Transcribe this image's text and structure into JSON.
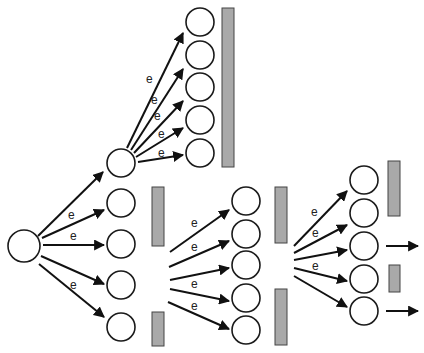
{
  "diagram": {
    "type": "branching tree of nodes with gray bars",
    "edge_label": "e",
    "colors": {
      "node_stroke": "#1a1a1a",
      "bar_fill": "#a9a9a9",
      "edge": "#111111",
      "background": "#ffffff"
    },
    "source": {
      "x": 24,
      "y": 246,
      "r": 16
    },
    "nodes": [
      {
        "id": "t1",
        "x": 200,
        "y": 22,
        "r": 14
      },
      {
        "id": "t2",
        "x": 200,
        "y": 55,
        "r": 14
      },
      {
        "id": "t3",
        "x": 200,
        "y": 87,
        "r": 14
      },
      {
        "id": "t4",
        "x": 200,
        "y": 120,
        "r": 14
      },
      {
        "id": "t5",
        "x": 200,
        "y": 153,
        "r": 14
      },
      {
        "id": "a0",
        "x": 121,
        "y": 163,
        "r": 14
      },
      {
        "id": "a1",
        "x": 121,
        "y": 203,
        "r": 14
      },
      {
        "id": "a2",
        "x": 121,
        "y": 244,
        "r": 14
      },
      {
        "id": "a3",
        "x": 121,
        "y": 285,
        "r": 14
      },
      {
        "id": "a4",
        "x": 121,
        "y": 327,
        "r": 14
      },
      {
        "id": "m1",
        "x": 246,
        "y": 201,
        "r": 14
      },
      {
        "id": "m2",
        "x": 246,
        "y": 234,
        "r": 14
      },
      {
        "id": "m3",
        "x": 246,
        "y": 265,
        "r": 14
      },
      {
        "id": "m4",
        "x": 246,
        "y": 298,
        "r": 14
      },
      {
        "id": "m5",
        "x": 246,
        "y": 330,
        "r": 14
      },
      {
        "id": "r1",
        "x": 364,
        "y": 180,
        "r": 14
      },
      {
        "id": "r2",
        "x": 364,
        "y": 213,
        "r": 14
      },
      {
        "id": "r3",
        "x": 364,
        "y": 246,
        "r": 14
      },
      {
        "id": "r4",
        "x": 364,
        "y": 279,
        "r": 14
      },
      {
        "id": "r5",
        "x": 364,
        "y": 311,
        "r": 14
      }
    ],
    "bars": [
      {
        "x": 222,
        "y": 8,
        "w": 12,
        "h": 159
      },
      {
        "x": 152,
        "y": 187,
        "w": 12,
        "h": 59
      },
      {
        "x": 152,
        "y": 312,
        "w": 12,
        "h": 34
      },
      {
        "x": 275,
        "y": 187,
        "w": 12,
        "h": 56
      },
      {
        "x": 275,
        "y": 289,
        "w": 12,
        "h": 56
      },
      {
        "x": 388,
        "y": 161,
        "w": 12,
        "h": 55
      },
      {
        "x": 389,
        "y": 265,
        "w": 11,
        "h": 27
      }
    ],
    "edges": [
      {
        "x1": 38,
        "y1": 236,
        "x2": 103,
        "y2": 172,
        "label": ""
      },
      {
        "x1": 42,
        "y1": 238,
        "x2": 104,
        "y2": 210,
        "label": "e",
        "lx": 68,
        "ly": 219
      },
      {
        "x1": 43,
        "y1": 245,
        "x2": 104,
        "y2": 245,
        "label": "e",
        "lx": 70,
        "ly": 240
      },
      {
        "x1": 41,
        "y1": 256,
        "x2": 104,
        "y2": 284,
        "label": ""
      },
      {
        "x1": 39,
        "y1": 264,
        "x2": 104,
        "y2": 317,
        "label": "e",
        "lx": 70,
        "ly": 289
      },
      {
        "x1": 127,
        "y1": 148,
        "x2": 183,
        "y2": 33,
        "label": "e",
        "lx": 146,
        "ly": 83
      },
      {
        "x1": 131,
        "y1": 150,
        "x2": 183,
        "y2": 69,
        "label": "e",
        "lx": 151,
        "ly": 104
      },
      {
        "x1": 134,
        "y1": 153,
        "x2": 183,
        "y2": 101,
        "label": "e",
        "lx": 154,
        "ly": 120
      },
      {
        "x1": 136,
        "y1": 157,
        "x2": 183,
        "y2": 128,
        "label": "e",
        "lx": 158,
        "ly": 138
      },
      {
        "x1": 138,
        "y1": 162,
        "x2": 183,
        "y2": 155,
        "label": "e",
        "lx": 158,
        "ly": 157
      },
      {
        "x1": 170,
        "y1": 252,
        "x2": 229,
        "y2": 210,
        "label": "e",
        "lx": 191,
        "ly": 227
      },
      {
        "x1": 169,
        "y1": 267,
        "x2": 229,
        "y2": 241,
        "label": "e",
        "lx": 191,
        "ly": 251
      },
      {
        "x1": 170,
        "y1": 280,
        "x2": 229,
        "y2": 268,
        "label": ""
      },
      {
        "x1": 170,
        "y1": 289,
        "x2": 229,
        "y2": 301,
        "label": "e",
        "lx": 191,
        "ly": 288
      },
      {
        "x1": 168,
        "y1": 302,
        "x2": 229,
        "y2": 329,
        "label": "e",
        "lx": 191,
        "ly": 310
      },
      {
        "x1": 294,
        "y1": 246,
        "x2": 347,
        "y2": 191,
        "label": "e",
        "lx": 311,
        "ly": 216
      },
      {
        "x1": 294,
        "y1": 253,
        "x2": 347,
        "y2": 225,
        "label": "e",
        "lx": 312,
        "ly": 237
      },
      {
        "x1": 294,
        "y1": 260,
        "x2": 347,
        "y2": 250,
        "label": ""
      },
      {
        "x1": 294,
        "y1": 268,
        "x2": 347,
        "y2": 281,
        "label": "e",
        "lx": 312,
        "ly": 270
      },
      {
        "x1": 294,
        "y1": 276,
        "x2": 347,
        "y2": 307,
        "label": ""
      },
      {
        "x1": 386,
        "y1": 246,
        "x2": 418,
        "y2": 246,
        "label": ""
      },
      {
        "x1": 386,
        "y1": 311,
        "x2": 418,
        "y2": 311,
        "label": ""
      }
    ]
  }
}
